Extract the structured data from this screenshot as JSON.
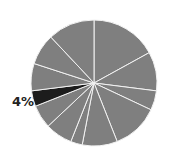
{
  "chart_data": {
    "type": "pie",
    "title": "",
    "start_angle_deg": 0,
    "direction": "clockwise",
    "values": [
      17,
      10,
      5,
      12,
      9,
      3,
      7,
      6,
      4,
      7,
      8,
      12
    ],
    "highlight_index": 8,
    "labels": [
      "",
      "",
      "",
      "",
      "",
      "",
      "",
      "",
      "4%",
      "",
      "",
      ""
    ],
    "colors": {
      "default": "#7f7f7f",
      "highlight": "#1c1c1c",
      "edge": "#f2f2f2"
    }
  },
  "annotation": {
    "text": "4%"
  }
}
